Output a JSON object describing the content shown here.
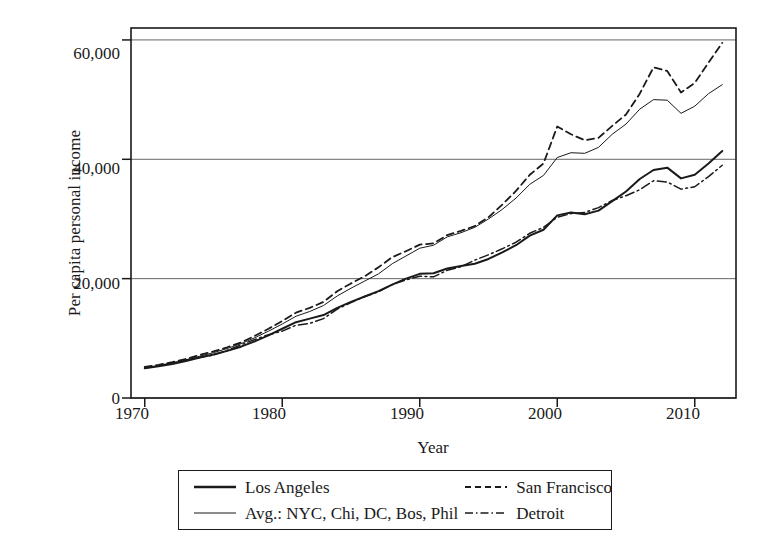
{
  "chart_data": {
    "type": "line",
    "title": "",
    "xlabel": "Year",
    "ylabel": "Per capita personal income",
    "xlim": [
      1969,
      2013
    ],
    "ylim": [
      0,
      62000
    ],
    "grid": true,
    "legend_position": "below-axes",
    "xticks": [
      1970,
      1980,
      1990,
      2000,
      2010
    ],
    "xtick_labels": [
      "1970",
      "1980",
      "1990",
      "2000",
      "2010"
    ],
    "yticks": [
      0,
      20000,
      40000,
      60000
    ],
    "ytick_labels": [
      "0",
      "20,000",
      "40,000",
      "60,000"
    ],
    "x": [
      1970,
      1971,
      1972,
      1973,
      1974,
      1975,
      1976,
      1977,
      1978,
      1979,
      1980,
      1981,
      1982,
      1983,
      1984,
      1985,
      1986,
      1987,
      1988,
      1989,
      1990,
      1991,
      1992,
      1993,
      1994,
      1995,
      1996,
      1997,
      1998,
      1999,
      2000,
      2001,
      2002,
      2003,
      2004,
      2005,
      2006,
      2007,
      2008,
      2009,
      2010,
      2011,
      2012
    ],
    "series": [
      {
        "name": "Los Angeles",
        "style": "solid",
        "width": 2.0,
        "color": "#1a1a1a",
        "values": [
          5000,
          5300,
          5700,
          6200,
          6800,
          7300,
          7900,
          8600,
          9500,
          10500,
          11600,
          12700,
          13300,
          13900,
          15100,
          16100,
          17000,
          17900,
          19000,
          20000,
          20800,
          20900,
          21700,
          22100,
          22500,
          23300,
          24400,
          25600,
          27200,
          28200,
          30600,
          31100,
          30800,
          31400,
          33000,
          34600,
          36700,
          38200,
          38600,
          36800,
          37400,
          39300,
          41400
        ]
      },
      {
        "name": "Avg.: NYC, Chi, DC, Bos, Phil",
        "style": "solid",
        "width": 1.0,
        "color": "#1a1a1a",
        "values": [
          5100,
          5450,
          5900,
          6400,
          7000,
          7600,
          8300,
          9100,
          10100,
          11200,
          12400,
          13700,
          14500,
          15500,
          17100,
          18400,
          19600,
          20800,
          22500,
          23800,
          25100,
          25600,
          27000,
          27700,
          28600,
          30000,
          31600,
          33500,
          35800,
          37300,
          40300,
          41100,
          41000,
          42000,
          44200,
          45900,
          48400,
          50000,
          49900,
          47700,
          48900,
          51000,
          52500
        ]
      },
      {
        "name": "San Francisco",
        "style": "dashed",
        "width": 1.8,
        "color": "#1a1a1a",
        "values": [
          5200,
          5550,
          6000,
          6550,
          7200,
          7800,
          8500,
          9300,
          10400,
          11600,
          12900,
          14300,
          15100,
          16100,
          17900,
          19200,
          20400,
          21900,
          23600,
          24600,
          25700,
          25900,
          27300,
          28000,
          28800,
          30300,
          32400,
          34700,
          37400,
          39300,
          45500,
          44200,
          43200,
          43600,
          45600,
          47500,
          51000,
          55400,
          54800,
          51200,
          52800,
          56200,
          59500
        ]
      },
      {
        "name": "Detroit",
        "style": "dashdot",
        "width": 1.5,
        "color": "#1a1a1a",
        "values": [
          5050,
          5350,
          5800,
          6350,
          6800,
          7200,
          8000,
          8900,
          9800,
          10600,
          11200,
          12200,
          12500,
          13300,
          14900,
          16000,
          17000,
          17800,
          19000,
          19800,
          20400,
          20300,
          21400,
          22000,
          23100,
          24000,
          25000,
          26100,
          27600,
          28600,
          30300,
          30900,
          31100,
          31900,
          33100,
          33900,
          34900,
          36400,
          36200,
          35000,
          35400,
          37100,
          39000
        ]
      }
    ]
  },
  "legend": {
    "items": [
      {
        "label": "Los Angeles",
        "style": "solid-thick"
      },
      {
        "label": "San Francisco",
        "style": "dashed"
      },
      {
        "label": "Avg.: NYC, Chi, DC, Bos, Phil",
        "style": "solid-thin"
      },
      {
        "label": "Detroit",
        "style": "dashdot"
      }
    ]
  },
  "axes": {
    "ylabel": "Per capita personal income",
    "xlabel": "Year"
  }
}
